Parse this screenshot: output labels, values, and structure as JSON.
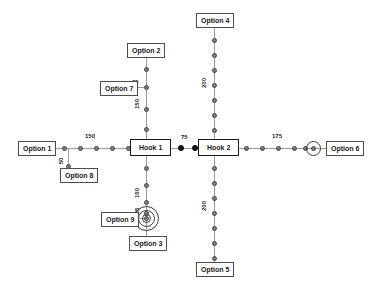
{
  "diagram": {
    "background_color": "#ffffff",
    "line_color": "#9a9a9a",
    "node_color": "#7b7b7b",
    "filled_node_color": "#1a1a1a",
    "text_color": "#1a1a1a"
  },
  "hooks": [
    {
      "id": "hook1",
      "label": "Hook 1"
    },
    {
      "id": "hook2",
      "label": "Hook 2"
    }
  ],
  "options": [
    {
      "id": "option1",
      "label": "Option 1"
    },
    {
      "id": "option2",
      "label": "Option 2"
    },
    {
      "id": "option3",
      "label": "Option 3"
    },
    {
      "id": "option4",
      "label": "Option 4"
    },
    {
      "id": "option5",
      "label": "Option 5"
    },
    {
      "id": "option6",
      "label": "Option 6"
    },
    {
      "id": "option7",
      "label": "Option 7"
    },
    {
      "id": "option8",
      "label": "Option 8"
    },
    {
      "id": "option9",
      "label": "Option 9"
    }
  ],
  "dimensions": [
    {
      "id": "dim-left-main",
      "value": "150",
      "orientation": "horizontal"
    },
    {
      "id": "dim-option8",
      "value": "50",
      "orientation": "vertical"
    },
    {
      "id": "dim-hooks-gap",
      "value": "75",
      "orientation": "horizontal"
    },
    {
      "id": "dim-right-main",
      "value": "175",
      "orientation": "horizontal"
    },
    {
      "id": "dim-option7",
      "value": "25",
      "orientation": "horizontal"
    },
    {
      "id": "dim-hook1-up",
      "value": "150",
      "orientation": "vertical"
    },
    {
      "id": "dim-hook1-down",
      "value": "150",
      "orientation": "vertical"
    },
    {
      "id": "dim-option9",
      "value": "25",
      "orientation": "vertical"
    },
    {
      "id": "dim-hook2-up",
      "value": "200",
      "orientation": "vertical"
    },
    {
      "id": "dim-hook2-down",
      "value": "200",
      "orientation": "vertical"
    }
  ]
}
